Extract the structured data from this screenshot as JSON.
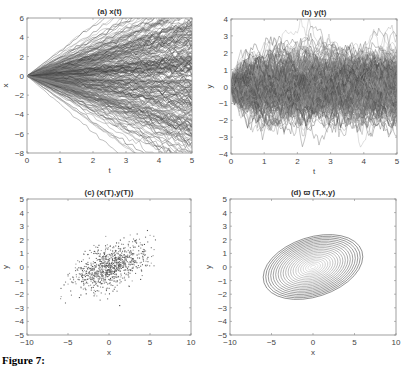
{
  "figure": {
    "caption_prefix": "Figure 7:",
    "caption_rest": "(partially cut off)"
  },
  "chart_data": [
    {
      "id": "a",
      "type": "line",
      "title": "(a) x(t)",
      "xlabel": "t",
      "ylabel": "x",
      "xlim": [
        0,
        5
      ],
      "ylim": [
        -8,
        6
      ],
      "xticks": [
        0,
        1,
        2,
        3,
        4,
        5
      ],
      "yticks": [
        -8,
        -6,
        -4,
        -2,
        0,
        2,
        4,
        6
      ],
      "grid": false,
      "description": "Many simulated sample paths x(t) all starting at 0 at t=0 and fanning out; spread approx ±6 at t=5",
      "series_summary": {
        "start": 0,
        "upper_envelope_t5": 5.8,
        "lower_envelope_t5": -6.9,
        "num_paths_approx": 500
      },
      "box": {
        "left": 27,
        "right": 192,
        "top": 18,
        "bottom": 153
      }
    },
    {
      "id": "b",
      "type": "line",
      "title": "(b) y(t)",
      "xlabel": "t",
      "ylabel": "y",
      "xlim": [
        0,
        5
      ],
      "ylim": [
        -4,
        4
      ],
      "xticks": [
        0,
        1,
        2,
        3,
        4,
        5
      ],
      "yticks": [
        -4,
        -3,
        -2,
        -1,
        0,
        1,
        2,
        3,
        4
      ],
      "grid": false,
      "description": "Many noisy mean-reverting sample paths y(t) starting near 0, quickly spreading to a stationary band of roughly ±2 (extremes ±3)",
      "series_summary": {
        "start": 0,
        "band": [
          -2,
          2
        ],
        "extremes": [
          -3,
          3
        ],
        "num_paths_approx": 500
      },
      "box": {
        "left": 231,
        "right": 397,
        "top": 19,
        "bottom": 154
      }
    },
    {
      "id": "c",
      "type": "scatter",
      "title": "(c) (x(T),y(T))",
      "xlabel": "x",
      "ylabel": "y",
      "xlim": [
        -10,
        10
      ],
      "ylim": [
        -5,
        5
      ],
      "xticks": [
        -10,
        -5,
        0,
        5,
        10
      ],
      "yticks": [
        -5,
        -4,
        -3,
        -2,
        -1,
        0,
        1,
        2,
        3,
        4,
        5
      ],
      "grid": false,
      "description": "Scatter of terminal values (x(T), y(T)); cloud centered at (0,0) with positive correlation, x in ~[-7,6], y in ~[-3,2.5]",
      "series_summary": {
        "center": [
          0,
          0
        ],
        "x_range": [
          -7,
          6
        ],
        "y_range": [
          -2.8,
          2.3
        ],
        "correlation": "positive",
        "num_points_approx": 1000
      },
      "box": {
        "left": 27,
        "right": 191,
        "top": 199,
        "bottom": 335
      }
    },
    {
      "id": "d",
      "type": "contour",
      "title": "(d) ϖ (T,x,y)",
      "xlabel": "x",
      "ylabel": "y",
      "xlim": [
        -10,
        10
      ],
      "ylim": [
        -5,
        5
      ],
      "xticks": [
        -10,
        -5,
        0,
        5,
        10
      ],
      "yticks": [
        -5,
        -4,
        -3,
        -2,
        -1,
        0,
        1,
        2,
        3,
        4,
        5
      ],
      "grid": false,
      "description": "Contour plot of bivariate Gaussian density centered at (0,0), tilted ellipses, outermost spanning x ~[-6.2,6.2], y ~[-2.2,2.2]",
      "series_summary": {
        "center": [
          0,
          0
        ],
        "outer_x_extent": [
          -6.2,
          6.2
        ],
        "outer_y_extent": [
          -2.2,
          2.2
        ],
        "num_levels_approx": 20
      },
      "box": {
        "left": 230,
        "right": 396,
        "top": 199,
        "bottom": 335
      }
    }
  ]
}
